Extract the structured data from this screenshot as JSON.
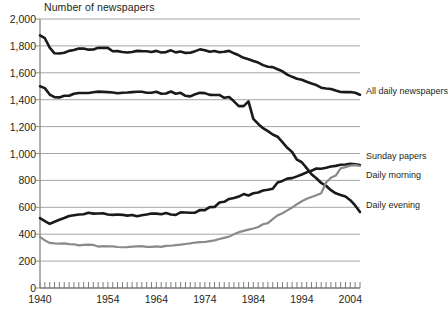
{
  "chart_data": {
    "type": "line",
    "title": "Number of newspapers",
    "xlabel": "",
    "ylabel": "",
    "xlim": [
      1940,
      2006
    ],
    "ylim": [
      0,
      2000
    ],
    "ytick_step": 200,
    "grid": true,
    "legend_position": "right-inline-labels",
    "xticks_labeled": [
      "1940",
      "1954",
      "1964",
      "1974",
      "1984",
      "1994",
      "2004"
    ],
    "xtick_values": [
      1940,
      1954,
      1964,
      1974,
      1984,
      1994,
      2004
    ],
    "xtick_minor_interval": 1,
    "yticks": [
      "0",
      "200",
      "400",
      "600",
      "800",
      "1,000",
      "1,200",
      "1,400",
      "1,600",
      "1,800",
      "2,000"
    ],
    "ytick_values": [
      0,
      200,
      400,
      600,
      800,
      1000,
      1200,
      1400,
      1600,
      1800,
      2000
    ],
    "x": [
      1940,
      1941,
      1942,
      1943,
      1944,
      1945,
      1946,
      1947,
      1948,
      1949,
      1950,
      1951,
      1952,
      1953,
      1954,
      1955,
      1956,
      1957,
      1958,
      1959,
      1960,
      1961,
      1962,
      1963,
      1964,
      1965,
      1966,
      1967,
      1968,
      1969,
      1970,
      1971,
      1972,
      1973,
      1974,
      1975,
      1976,
      1977,
      1978,
      1979,
      1980,
      1981,
      1982,
      1983,
      1984,
      1985,
      1986,
      1987,
      1988,
      1989,
      1990,
      1991,
      1992,
      1993,
      1994,
      1995,
      1996,
      1997,
      1998,
      1999,
      2000,
      2001,
      2002,
      2003,
      2004,
      2005,
      2006
    ],
    "series": [
      {
        "name": "All daily newspapers",
        "color": "#1a1a1a",
        "width": 2.6,
        "label_x": 366,
        "label_y": 92,
        "values": [
          1878,
          1857,
          1787,
          1745,
          1744,
          1749,
          1763,
          1769,
          1781,
          1780,
          1772,
          1773,
          1786,
          1785,
          1785,
          1760,
          1761,
          1755,
          1751,
          1755,
          1763,
          1761,
          1760,
          1754,
          1763,
          1751,
          1754,
          1767,
          1752,
          1758,
          1748,
          1749,
          1761,
          1774,
          1768,
          1756,
          1762,
          1753,
          1756,
          1763,
          1745,
          1730,
          1711,
          1701,
          1688,
          1676,
          1657,
          1645,
          1642,
          1626,
          1611,
          1586,
          1570,
          1556,
          1548,
          1533,
          1520,
          1509,
          1489,
          1483,
          1480,
          1468,
          1457,
          1456,
          1457,
          1452,
          1437
        ]
      },
      {
        "name": "Daily evening",
        "color": "#1a1a1a",
        "width": 2.6,
        "label_x": 366,
        "label_y": 206,
        "values": [
          1500,
          1486,
          1438,
          1419,
          1417,
          1429,
          1429,
          1444,
          1450,
          1450,
          1450,
          1456,
          1460,
          1458,
          1456,
          1454,
          1448,
          1452,
          1453,
          1456,
          1459,
          1459,
          1452,
          1452,
          1459,
          1444,
          1446,
          1461,
          1444,
          1451,
          1429,
          1425,
          1441,
          1451,
          1449,
          1436,
          1435,
          1435,
          1414,
          1420,
          1388,
          1352,
          1352,
          1388,
          1257,
          1220,
          1188,
          1166,
          1141,
          1125,
          1084,
          1042,
          1011,
          954,
          935,
          891,
          846,
          816,
          781,
          760,
          727,
          704,
          692,
          680,
          653,
          614,
          565
        ]
      },
      {
        "name": "Daily morning",
        "color": "#1a1a1a",
        "width": 2.6,
        "label_x": 366,
        "label_y": 176,
        "values": [
          520,
          498,
          477,
          493,
          507,
          520,
          535,
          541,
          547,
          548,
          559,
          553,
          554,
          556,
          546,
          544,
          546,
          544,
          538,
          543,
          534,
          541,
          546,
          554,
          553,
          548,
          557,
          547,
          544,
          562,
          561,
          559,
          560,
          580,
          579,
          601,
          602,
          636,
          641,
          662,
          669,
          680,
          698,
          688,
          704,
          710,
          725,
          731,
          738,
          785,
          796,
          813,
          817,
          830,
          844,
          860,
          872,
          888,
          887,
          894,
          903,
          908,
          916,
          918,
          923,
          919,
          915
        ]
      },
      {
        "name": "Sunday papers",
        "color": "#8a8a8a",
        "width": 2.2,
        "label_x": 366,
        "label_y": 157,
        "values": [
          380,
          354,
          335,
          332,
          330,
          332,
          326,
          325,
          317,
          320,
          322,
          320,
          308,
          312,
          310,
          309,
          305,
          303,
          304,
          308,
          310,
          311,
          306,
          306,
          309,
          306,
          313,
          314,
          319,
          322,
          327,
          332,
          338,
          341,
          342,
          348,
          354,
          364,
          373,
          382,
          399,
          415,
          425,
          434,
          442,
          453,
          474,
          482,
          512,
          540,
          556,
          577,
          598,
          623,
          645,
          664,
          677,
          689,
          704,
          784,
          820,
          836,
          889,
          899,
          910,
          914,
          907
        ]
      }
    ]
  },
  "axes": {
    "title": "Number of newspapers"
  }
}
